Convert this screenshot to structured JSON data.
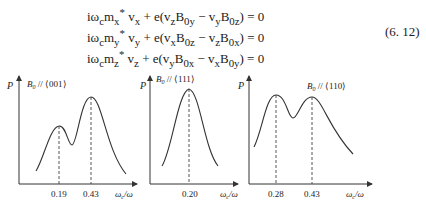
{
  "equations": {
    "lines": [
      "iωₒmₓ* vₓ + e(vₓB₀ᵧ − vᵧB₀ₓ) = 0",
      "iωₒmᵧ* vᵧ + e(vₓB₀ₓ − vₓB₀ₓ) = 0",
      "iωₒmₓ* vₓ + e(vᵧB₀ₓ − vₓB₀ᵧ) = 0"
    ],
    "display": [
      "iω<sub>c</sub>m<sub>x</sub><sup>*</sup> v<sub>x</sub> + e(v<sub>z</sub>B<sub>0y</sub> − v<sub>y</sub>B<sub>0z</sub>) = 0",
      "iω<sub>c</sub>m<sub>y</sub><sup>*</sup> v<sub>y</sub> + e(v<sub>x</sub>B<sub>0z</sub> − v<sub>z</sub>B<sub>0x</sub>) = 0",
      "iω<sub>c</sub>m<sub>z</sub><sup>*</sup> v<sub>z</sub> + e(v<sub>y</sub>B<sub>0x</sub> − v<sub>x</sub>B<sub>0y</sub>) = 0"
    ],
    "number": "(6. 12)"
  },
  "chart_data": [
    {
      "type": "line",
      "title": "B0 ∥ ⟨001⟩",
      "xlabel": "ωc/ω",
      "ylabel": "P",
      "grid": false,
      "peaks_x": [
        0.19,
        0.43
      ],
      "tick_labels": [
        "0.19",
        "0.43"
      ],
      "shape": "two peaks, second (0.43) higher than first (0.19)"
    },
    {
      "type": "line",
      "title": "B0 ∥ ⟨111⟩",
      "xlabel": "ωc/ω",
      "ylabel": "P",
      "grid": false,
      "peaks_x": [
        0.2
      ],
      "tick_labels": [
        "0.20"
      ],
      "shape": "single peak at 0.20"
    },
    {
      "type": "line",
      "title": "B0 ∥ ⟨110⟩",
      "xlabel": "ωc/ω",
      "ylabel": "P",
      "grid": false,
      "peaks_x": [
        0.28,
        0.43
      ],
      "tick_labels": [
        "0.28",
        "0.43"
      ],
      "shape": "two peaks of nearly equal height at 0.28 and 0.43"
    }
  ],
  "figures": {
    "left": {
      "y_label": "P",
      "title_main": "B",
      "title_sub": "0",
      "title_rest": " // ⟨001⟩",
      "ticks": [
        "0.19",
        "0.43"
      ],
      "x_main": "ω",
      "x_sub": "c",
      "x_rest": "/ω"
    },
    "middle": {
      "y_label": "P",
      "title_main": "B",
      "title_sub": "0",
      "title_rest": " // ⟨111⟩",
      "ticks": [
        "0.20"
      ],
      "x_main": "ω",
      "x_sub": "c",
      "x_rest": "/ω"
    },
    "right": {
      "y_label": "P",
      "title_main": "B",
      "title_sub": "0",
      "title_rest": " // ⟨110⟩",
      "ticks": [
        "0.28",
        "0.43"
      ],
      "x_main": "ω",
      "x_sub": "c",
      "x_rest": "/ω"
    }
  }
}
